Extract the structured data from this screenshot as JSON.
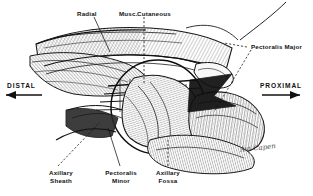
{
  "figure": {
    "type": "anatomical-illustration",
    "background_color": "#ffffff",
    "ink_color": "#111111",
    "signature": "Avi Capen"
  },
  "labels": {
    "radial": "Radial",
    "musc": "Musc.",
    "cutaneous": "Cutaneous",
    "pectoralis_major": "Pectoralis Major",
    "axillary_sheath_l1": "Axillary",
    "axillary_sheath_l2": "Sheath",
    "pectoralis_minor_l1": "Pectoralis",
    "pectoralis_minor_l2": "Minor",
    "axillary_fossa_l1": "Axillary",
    "axillary_fossa_l2": "Fossa"
  },
  "directions": {
    "distal": "DISTAL",
    "proximal": "PROXIMAL"
  }
}
